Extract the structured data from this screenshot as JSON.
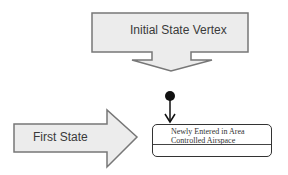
{
  "diagram": {
    "type": "uml-state-diagram-annotated",
    "colors": {
      "callout_fill": "#ececec",
      "callout_stroke": "#777777",
      "state_stroke": "#333333",
      "initial_dot": "#111111",
      "background": "#ffffff"
    },
    "callouts": {
      "initial_state_vertex": {
        "label": "Initial State Vertex",
        "direction": "down"
      },
      "first_state": {
        "label": "First State",
        "direction": "right"
      }
    },
    "initial_pseudostate": {
      "shape": "filled-circle"
    },
    "state": {
      "name_line1": "Newly Entered in Area",
      "name_line2": "Controlled Airspace"
    }
  }
}
